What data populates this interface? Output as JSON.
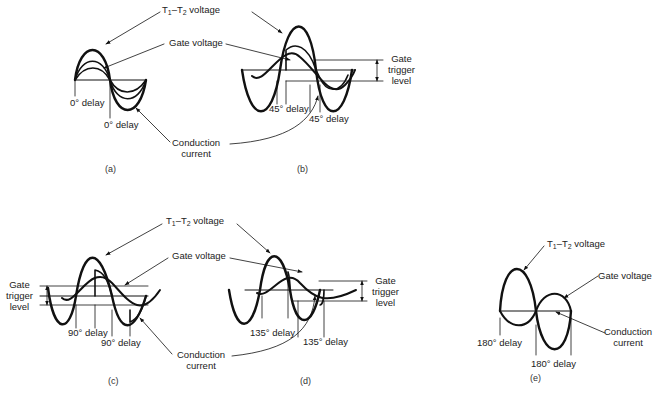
{
  "figure": {
    "panels": [
      {
        "id": "a",
        "caption": "(a)",
        "delay_deg": 0,
        "labels": {
          "t1t2": "T",
          "t1t2_sub1": "1",
          "t1t2_dash": "–T",
          "t1t2_sub2": "2",
          "t1t2_tail": " voltage",
          "gate_voltage": "Gate voltage",
          "conduction_line1": "Conduction",
          "conduction_line2": "current",
          "delay1": "0° delay",
          "delay2": "0° delay"
        }
      },
      {
        "id": "b",
        "caption": "(b)",
        "delay_deg": 45,
        "labels": {
          "gate_trigger_line1": "Gate",
          "gate_trigger_line2": "trigger",
          "gate_trigger_line3": "level",
          "delay1": "45° delay",
          "delay2": "45° delay"
        }
      },
      {
        "id": "c",
        "caption": "(c)",
        "delay_deg": 90,
        "labels": {
          "t1t2": "T",
          "t1t2_sub1": "1",
          "t1t2_dash": "–T",
          "t1t2_sub2": "2",
          "t1t2_tail": " voltage",
          "gate_voltage": "Gate voltage",
          "gate_trigger_line1": "Gate",
          "gate_trigger_line2": "trigger",
          "gate_trigger_line3": "level",
          "conduction_line1": "Conduction",
          "conduction_line2": "current",
          "delay1": "90° delay",
          "delay2": "90° delay"
        }
      },
      {
        "id": "d",
        "caption": "(d)",
        "delay_deg": 135,
        "labels": {
          "gate_trigger_line1": "Gate",
          "gate_trigger_line2": "trigger",
          "gate_trigger_line3": "level",
          "delay1": "135° delay",
          "delay2": "135° delay"
        }
      },
      {
        "id": "e",
        "caption": "(e)",
        "delay_deg": 180,
        "labels": {
          "t1t2": "T",
          "t1t2_sub1": "1",
          "t1t2_dash": "–T",
          "t1t2_sub2": "2",
          "t1t2_tail": " voltage",
          "gate_voltage": "Gate voltage",
          "conduction_line1": "Conduction",
          "conduction_line2": "current",
          "delay1": "180° delay",
          "delay2": "180° delay"
        }
      }
    ]
  }
}
